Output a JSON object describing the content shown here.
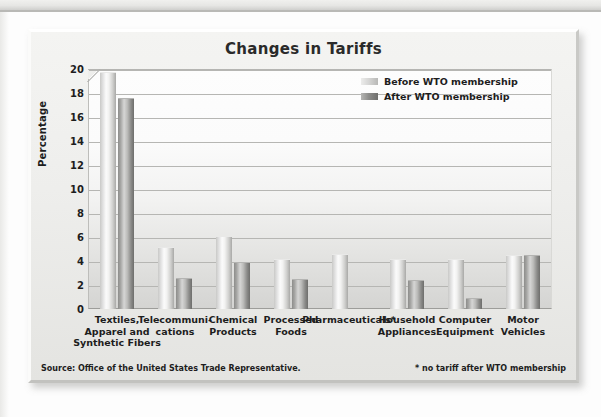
{
  "chart_data": {
    "type": "bar",
    "title": "Changes in Tariffs",
    "xlabel": "",
    "ylabel": "Percentage",
    "ylim": [
      0,
      20
    ],
    "yticks": [
      20,
      18,
      16,
      14,
      12,
      10,
      8,
      6,
      4,
      2,
      0
    ],
    "grid": true,
    "legend_position": "top-right",
    "categories": [
      "Textiles,\nApparel and\nSynthetic Fibers",
      "Telecommuni-\ncations",
      "Chemical\nProducts",
      "Processed\nFoods",
      "Pharmaceuticals*",
      "Household\nAppliances",
      "Computer\nEquipment",
      "Motor\nVehicles"
    ],
    "series": [
      {
        "name": "Before WTO membership",
        "values": [
          19.7,
          5.1,
          6.0,
          4.1,
          4.5,
          4.1,
          4.1,
          4.4
        ]
      },
      {
        "name": "After WTO membership",
        "values": [
          17.5,
          2.5,
          3.8,
          2.4,
          0,
          2.3,
          0.8,
          4.4
        ]
      }
    ],
    "annotations": [
      "Source: Office of the United States Trade Representative.",
      "* no tariff after WTO membership"
    ]
  },
  "chart": {
    "title": "Changes in Tariffs",
    "y_axis_title": "Percentage",
    "y_ticks": [
      "20",
      "18",
      "16",
      "14",
      "12",
      "10",
      "8",
      "6",
      "4",
      "2",
      "0"
    ],
    "legend": [
      {
        "label": "Before WTO membership",
        "swatch": "before"
      },
      {
        "label": "After WTO membership",
        "swatch": "after"
      }
    ],
    "categories": [
      {
        "line1": "Textiles,",
        "line2": "Apparel and",
        "line3": "Synthetic Fibers"
      },
      {
        "line1": "Telecommuni-",
        "line2": "cations",
        "line3": ""
      },
      {
        "line1": "Chemical",
        "line2": "Products",
        "line3": ""
      },
      {
        "line1": "Processed",
        "line2": "Foods",
        "line3": ""
      },
      {
        "line1": "Pharmaceuticals*",
        "line2": "",
        "line3": ""
      },
      {
        "line1": "Household",
        "line2": "Appliances",
        "line3": ""
      },
      {
        "line1": "Computer",
        "line2": "Equipment",
        "line3": ""
      },
      {
        "line1": "Motor",
        "line2": "Vehicles",
        "line3": ""
      }
    ],
    "source_note": "Source: Office of the United States Trade Representative.",
    "footnote": "* no tariff after WTO membership",
    "colors": {
      "bar_before": "#e8e8e7",
      "bar_after": "#8d8d8b",
      "gridline": "#b6b6b3",
      "text": "#1d1d1d",
      "frame": "#eeeeec"
    }
  }
}
